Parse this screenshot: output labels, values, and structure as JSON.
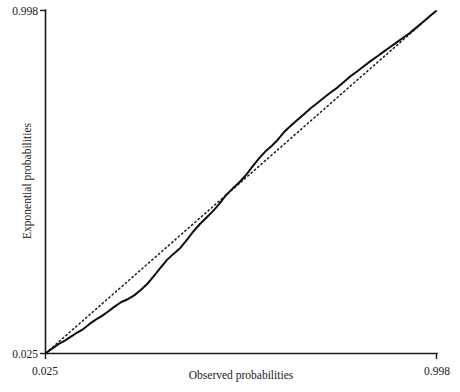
{
  "chart_data": {
    "type": "line",
    "title": "",
    "subtitle": "",
    "xlabel": "Observed probabilities",
    "ylabel": "Exponential probabilities",
    "xlim": [
      0.025,
      0.998
    ],
    "ylim": [
      0.025,
      0.998
    ],
    "xticks": [
      "0.025",
      "0.998"
    ],
    "yticks": [
      "0.025",
      "0.998"
    ],
    "grid": false,
    "legend": "none",
    "annotations": [],
    "series": [
      {
        "name": "Reference line",
        "style": "dotted",
        "x": [
          0.025,
          0.998
        ],
        "y": [
          0.025,
          0.998
        ]
      },
      {
        "name": "Empirical P-P curve",
        "style": "solid",
        "x": [
          0.025,
          0.041,
          0.056,
          0.072,
          0.089,
          0.104,
          0.118,
          0.133,
          0.149,
          0.164,
          0.18,
          0.196,
          0.213,
          0.229,
          0.245,
          0.262,
          0.278,
          0.294,
          0.311,
          0.327,
          0.343,
          0.36,
          0.376,
          0.392,
          0.409,
          0.425,
          0.441,
          0.458,
          0.474,
          0.49,
          0.507,
          0.523,
          0.539,
          0.556,
          0.572,
          0.588,
          0.605,
          0.621,
          0.637,
          0.654,
          0.67,
          0.686,
          0.703,
          0.719,
          0.735,
          0.752,
          0.768,
          0.784,
          0.801,
          0.817,
          0.833,
          0.85,
          0.866,
          0.882,
          0.899,
          0.915,
          0.931,
          0.948,
          0.964,
          0.98,
          0.998
        ],
        "y": [
          0.025,
          0.038,
          0.05,
          0.06,
          0.073,
          0.084,
          0.093,
          0.107,
          0.12,
          0.13,
          0.143,
          0.157,
          0.17,
          0.178,
          0.189,
          0.205,
          0.222,
          0.244,
          0.268,
          0.29,
          0.307,
          0.324,
          0.346,
          0.37,
          0.392,
          0.41,
          0.428,
          0.45,
          0.474,
          0.492,
          0.51,
          0.53,
          0.554,
          0.578,
          0.598,
          0.614,
          0.634,
          0.656,
          0.673,
          0.69,
          0.706,
          0.722,
          0.737,
          0.752,
          0.766,
          0.78,
          0.796,
          0.812,
          0.826,
          0.84,
          0.854,
          0.868,
          0.881,
          0.894,
          0.908,
          0.921,
          0.934,
          0.95,
          0.965,
          0.981,
          0.998
        ]
      }
    ]
  },
  "axes": {
    "y_top_label": "0.998",
    "y_bottom_label": "0.025",
    "x_left_label": "0.025",
    "x_right_label": "0.998",
    "x_title": "Observed probabilities",
    "y_title": "Exponential probabilities"
  }
}
